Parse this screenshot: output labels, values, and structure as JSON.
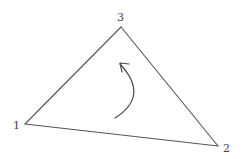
{
  "diagram": {
    "type": "triangle-orientation",
    "vertices": [
      {
        "id": "1",
        "label": "1",
        "x": 25,
        "y": 124,
        "label_x": 13,
        "label_y": 129
      },
      {
        "id": "2",
        "label": "2",
        "x": 218,
        "y": 146,
        "label_x": 223,
        "label_y": 152
      },
      {
        "id": "3",
        "label": "3",
        "x": 121,
        "y": 27,
        "label_x": 117,
        "label_y": 21
      }
    ],
    "edges": [
      {
        "from": "1",
        "to": "2"
      },
      {
        "from": "2",
        "to": "3"
      },
      {
        "from": "3",
        "to": "1"
      }
    ],
    "arrow": {
      "direction": "counterclockwise",
      "path": "M 115 118 Q 150 96 120 64",
      "head": "M 129 64 L 120 63 L 122 72"
    },
    "colors": {
      "line": "#555555",
      "label": "#444444",
      "background": "#ffffff"
    }
  }
}
